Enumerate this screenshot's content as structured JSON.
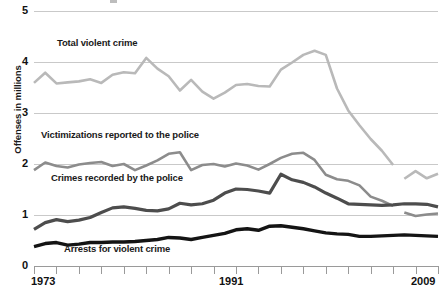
{
  "chart_data": {
    "type": "line",
    "title": "",
    "xlabel": "",
    "ylabel": "Offenses in millions",
    "xlim": [
      1973,
      2009
    ],
    "ylim": [
      0,
      5
    ],
    "grid": true,
    "legend_position": "inline-labels",
    "y_ticks": [
      "0",
      "1",
      "2",
      "3",
      "4",
      "5"
    ],
    "y_tick_values": [
      0,
      1,
      2,
      3,
      4,
      5
    ],
    "x_tick_values": [
      1973,
      1975,
      1977,
      1979,
      1981,
      1983,
      1985,
      1987,
      1989,
      1991,
      1993,
      1995,
      1997,
      1999,
      2001,
      2003,
      2005,
      2007,
      2009
    ],
    "x_tick_labels_shown": [
      "1973",
      "1991",
      "2009"
    ],
    "x_tick_label_years": [
      1973,
      1991,
      2009
    ],
    "years": [
      1973,
      1974,
      1975,
      1976,
      1977,
      1978,
      1979,
      1980,
      1981,
      1982,
      1983,
      1984,
      1985,
      1986,
      1987,
      1988,
      1989,
      1990,
      1991,
      1992,
      1993,
      1994,
      1995,
      1996,
      1997,
      1998,
      1999,
      2000,
      2001,
      2002,
      2003,
      2004,
      2005,
      2006,
      2007,
      2008,
      2009
    ],
    "series": [
      {
        "name": "Total violent crime",
        "color": "#b9b9b9",
        "stroke_width": 2.6,
        "label_x": 57,
        "label_y": 38,
        "has_gap": true,
        "gap_after_year": 2005,
        "values": [
          3.59,
          3.79,
          3.58,
          3.6,
          3.62,
          3.66,
          3.59,
          3.75,
          3.8,
          3.78,
          4.08,
          3.87,
          3.72,
          3.44,
          3.65,
          3.42,
          3.28,
          3.4,
          3.55,
          3.57,
          3.53,
          3.52,
          3.85,
          3.99,
          4.14,
          4.22,
          4.14,
          3.48,
          3.05,
          2.76,
          2.49,
          2.26,
          1.98,
          1.71,
          1.86,
          1.72,
          1.81
        ]
      },
      {
        "name": "Victimizations reported to the police",
        "color": "#8c8c8c",
        "stroke_width": 2.6,
        "label_x": 41,
        "label_y": 130,
        "has_gap": true,
        "gap_after_year": 2005,
        "values": [
          1.88,
          2.03,
          1.96,
          1.93,
          1.99,
          2.02,
          2.04,
          1.96,
          2.0,
          1.88,
          1.97,
          2.07,
          2.2,
          2.23,
          1.88,
          1.98,
          2.0,
          1.95,
          2.01,
          1.97,
          1.89,
          2.0,
          2.12,
          2.2,
          2.22,
          2.08,
          1.79,
          1.7,
          1.67,
          1.58,
          1.36,
          1.28,
          1.18,
          1.05,
          0.98,
          1.01,
          1.03
        ]
      },
      {
        "name": "Crimes recorded by the police",
        "color": "#4d4d4d",
        "stroke_width": 3.2,
        "label_x": 51,
        "label_y": 173,
        "has_gap": false,
        "values": [
          0.72,
          0.85,
          0.91,
          0.87,
          0.9,
          0.95,
          1.05,
          1.14,
          1.16,
          1.13,
          1.09,
          1.08,
          1.12,
          1.23,
          1.2,
          1.22,
          1.29,
          1.43,
          1.51,
          1.5,
          1.47,
          1.43,
          1.8,
          1.69,
          1.64,
          1.55,
          1.43,
          1.33,
          1.22,
          1.21,
          1.2,
          1.19,
          1.2,
          1.22,
          1.22,
          1.21,
          1.16
        ]
      },
      {
        "name": "Arrests for violent crime",
        "color": "#141414",
        "stroke_width": 3.4,
        "label_x": 64,
        "label_y": 244,
        "has_gap": false,
        "values": [
          0.38,
          0.44,
          0.46,
          0.41,
          0.43,
          0.46,
          0.46,
          0.47,
          0.47,
          0.48,
          0.5,
          0.52,
          0.56,
          0.55,
          0.52,
          0.56,
          0.6,
          0.64,
          0.71,
          0.73,
          0.7,
          0.78,
          0.79,
          0.76,
          0.73,
          0.69,
          0.65,
          0.63,
          0.62,
          0.58,
          0.58,
          0.59,
          0.6,
          0.61,
          0.6,
          0.59,
          0.58
        ]
      }
    ]
  },
  "axes": {
    "y_title": "Offenses in millions",
    "y_labels": {
      "v5": "5",
      "v4": "4",
      "v3": "3",
      "v2": "2",
      "v1": "1",
      "v0": "0"
    },
    "x_labels": {
      "start": "1973",
      "middle": "1991",
      "end": "2009"
    }
  },
  "series_labels": {
    "total_violent_crime": "Total violent crime",
    "victimizations_reported": "Victimizations reported to the police",
    "crimes_recorded": "Crimes recorded by the police",
    "arrests": "Arrests for violent crime"
  },
  "colors": {
    "total_violent_crime": "#b9b9b9",
    "victimizations_reported": "#8c8c8c",
    "crimes_recorded": "#4d4d4d",
    "arrests": "#141414",
    "gridline": "#c9c9c9",
    "axis": "#9a9a9a",
    "background": "#ffffff",
    "text": "#111111"
  }
}
